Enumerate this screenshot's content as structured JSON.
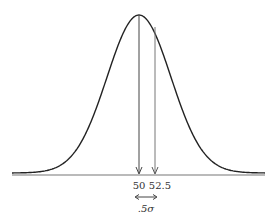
{
  "diagram": {
    "type": "normal-distribution-curve",
    "colors": {
      "curve": "#222222",
      "baseline": "#777777",
      "marker": "#555555",
      "text": "#333333"
    },
    "curve": {
      "mean_px": 139,
      "sigma_px": 32,
      "peak_y": 15,
      "base_y": 173
    },
    "baseline": {
      "x1": 12,
      "x2": 265,
      "y": 175
    },
    "markers": [
      {
        "label": "50",
        "x": 139
      },
      {
        "label": "52.5",
        "x": 155
      }
    ],
    "interval": {
      "label": ".5σ",
      "x1": 135,
      "x2": 157,
      "y": 197
    }
  }
}
